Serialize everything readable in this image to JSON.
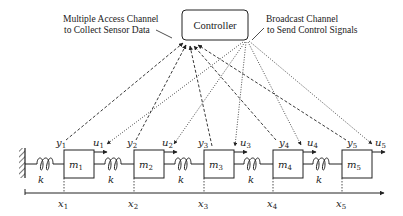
{
  "controller": {
    "label": "Controller"
  },
  "annotations": {
    "mac_line1": "Multiple Access Channel",
    "mac_line2": "to Collect Sensor Data",
    "bc_line1": "Broadcast Channel",
    "bc_line2": "to Send Control Signals"
  },
  "masses": [
    {
      "name": "m",
      "sub": "1"
    },
    {
      "name": "m",
      "sub": "2"
    },
    {
      "name": "m",
      "sub": "3"
    },
    {
      "name": "m",
      "sub": "4"
    },
    {
      "name": "m",
      "sub": "5"
    }
  ],
  "springs": {
    "label": "k"
  },
  "outputs": [
    {
      "name": "y",
      "sub": "1"
    },
    {
      "name": "y",
      "sub": "2"
    },
    {
      "name": "y",
      "sub": "3"
    },
    {
      "name": "y",
      "sub": "4"
    },
    {
      "name": "y",
      "sub": "5"
    }
  ],
  "inputs": [
    {
      "name": "u",
      "sub": "1"
    },
    {
      "name": "u",
      "sub": "2"
    },
    {
      "name": "u",
      "sub": "3"
    },
    {
      "name": "u",
      "sub": "4"
    },
    {
      "name": "u",
      "sub": "5"
    }
  ],
  "positions": [
    {
      "name": "x",
      "sub": "1"
    },
    {
      "name": "x",
      "sub": "2"
    },
    {
      "name": "x",
      "sub": "3"
    },
    {
      "name": "x",
      "sub": "4"
    },
    {
      "name": "x",
      "sub": "5"
    }
  ],
  "colors": {
    "stroke": "#222222",
    "background": "#ffffff"
  }
}
